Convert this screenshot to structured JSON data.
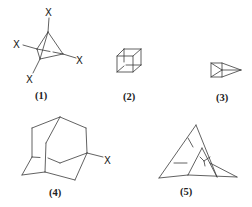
{
  "figure": {
    "structures": [
      {
        "id": 1,
        "label": "(1)",
        "name": "tetrasubstituted tetrahedrane",
        "substituent": "X",
        "substituent_count": 4
      },
      {
        "id": 2,
        "label": "(2)",
        "name": "cubane"
      },
      {
        "id": 3,
        "label": "(3)",
        "name": "prismane"
      },
      {
        "id": 4,
        "label": "(4)",
        "name": "1-substituted adamantane",
        "substituent": "X"
      },
      {
        "id": 5,
        "label": "(5)",
        "name": "polycyclic cage hydrocarbon"
      }
    ],
    "substituent_symbol": "X",
    "colors": {
      "line": "#3a3a3a",
      "text": "#222222",
      "background": "#ffffff"
    }
  }
}
